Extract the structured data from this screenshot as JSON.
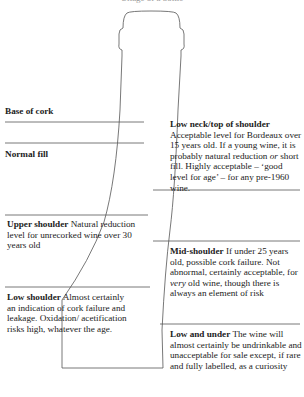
{
  "header": {
    "text": "Ullage of a bottle"
  },
  "diagram": {
    "levels": [
      {
        "id": "base-of-cork",
        "name": "Base of cork",
        "description": ""
      },
      {
        "id": "normal-fill",
        "name": "Normal fill",
        "description": ""
      },
      {
        "id": "low-neck",
        "name": "Low neck/top of shoulder",
        "description_parts": [
          "Acceptable level for Bordeaux over 15 years old. If a young wine, it is probably natural reduction ",
          "or",
          " short fill. Highly acceptable – ‘good level for age’ – for any pre-1960 wine."
        ]
      },
      {
        "id": "upper-shoulder",
        "name": "Upper shoulder",
        "description": "Natural reduction level for unrecorked wine over 30 years old"
      },
      {
        "id": "mid-shoulder",
        "name": "Mid-shoulder",
        "description_parts": [
          "If under 25 years old, possible cork failure. Not abnormal, certainly acceptable, for ",
          "very",
          " old wine, though there is always an element of risk"
        ]
      },
      {
        "id": "low-shoulder",
        "name": "Low shoulder",
        "description": "Almost certainly an indication of cork failure and leakage. Oxidation/ acetification risks high, whatever the age."
      },
      {
        "id": "low-and-under",
        "name": "Low and under",
        "description": "The wine will almost certainly be undrinkable and unacceptable for sale except, if rare and fully labelled, as a curiosity"
      }
    ]
  }
}
